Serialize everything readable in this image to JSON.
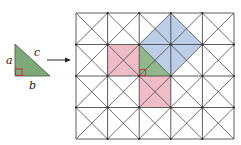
{
  "figure": {
    "colors": {
      "triangle_fill": "#7fa87a",
      "grid_triangle_fill": "#8fb88c",
      "leg_square_fill": "#f0bcc6",
      "hypotenuse_square_fill": "#bccde8",
      "right_angle_marker": "#d0303a",
      "grid_line": "#4a4a4a",
      "arrow": "#222222"
    },
    "triangle": {
      "labels": {
        "a": "a",
        "b": "b",
        "c": "c"
      }
    },
    "grid": {
      "columns": 5,
      "rows": 4,
      "cell_diagonals": true
    },
    "shaded_regions": [
      {
        "name": "leg-square-a",
        "color": "pink"
      },
      {
        "name": "leg-square-b",
        "color": "pink"
      },
      {
        "name": "hypotenuse-square-c",
        "color": "blue"
      },
      {
        "name": "triangle",
        "color": "green"
      }
    ]
  }
}
